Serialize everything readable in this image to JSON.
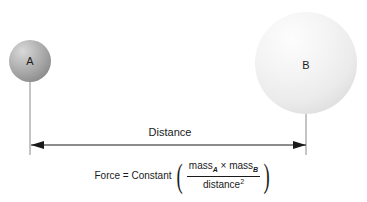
{
  "diagram": {
    "background_color": "#ffffff",
    "line_color": "#1a1a1a",
    "spheres": [
      {
        "id": "sphere-a",
        "label": "A",
        "center_x": 30,
        "center_y": 61,
        "radius": 21,
        "fill_color": "#a8a8a8",
        "highlight_color": "#d8d8d8",
        "shadow_color": "#808080"
      },
      {
        "id": "sphere-b",
        "label": "B",
        "center_x": 306,
        "center_y": 63,
        "radius": 51,
        "fill_color": "#f0f0f0",
        "highlight_color": "#fcfcfc",
        "shadow_color": "#dcdcdc"
      }
    ],
    "measure": {
      "label": "Distance",
      "arrow_y": 145,
      "arrow_left_x": 31,
      "arrow_right_x": 306,
      "leader_left_x": 30,
      "leader_right_x": 306,
      "leader_top_a": 82,
      "leader_top_b": 113,
      "leader_bottom": 155
    },
    "formula": {
      "lhs": "Force = Constant",
      "numerator": {
        "mass_a_base": "mass",
        "mass_a_sub": "A",
        "times": "×",
        "mass_b_base": "mass",
        "mass_b_sub": "B"
      },
      "denominator": {
        "base": "distance",
        "exponent": "2"
      },
      "paren_left": "(",
      "paren_right": ")"
    }
  }
}
